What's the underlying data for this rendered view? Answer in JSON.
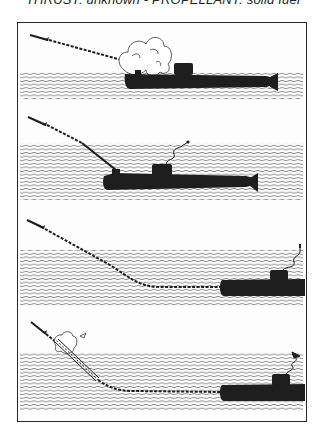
{
  "caption": "THRUST: unknown - PROPELLANT: solid fuel",
  "colors": {
    "ink": "#1e1e1e",
    "paper": "#fdfdfd",
    "water": "#6e6e6e"
  },
  "panels": [
    {
      "id": 1,
      "stage": "surfaced-launch",
      "water_top": 72,
      "water_bottom": 99,
      "features": [
        "missile",
        "dashed-trajectory",
        "smoke-cloud",
        "submarine-surfaced"
      ]
    },
    {
      "id": 2,
      "stage": "submerged-launch-tube",
      "water_top": 143,
      "water_bottom": 200,
      "features": [
        "missile",
        "dashed-trajectory",
        "launch-tube",
        "submarine-submerged",
        "antenna-cable"
      ]
    },
    {
      "id": 3,
      "stage": "submerged-curved-trajectory",
      "water_top": 250,
      "water_bottom": 306,
      "features": [
        "missile",
        "dashed-curved-trajectory",
        "submarine-partial",
        "antenna-cable"
      ]
    },
    {
      "id": 4,
      "stage": "capsule-breach",
      "water_top": 353,
      "water_bottom": 410,
      "features": [
        "missile",
        "capsule-tube",
        "puff-cloud",
        "dashed-curved-trajectory",
        "submarine-partial",
        "antenna-flag"
      ]
    }
  ]
}
